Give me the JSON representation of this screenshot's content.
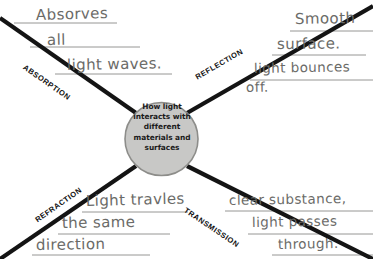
{
  "worksheet": {
    "title": "How light interacts with different materials and surfaces",
    "center": {
      "line1": "How light",
      "line2": "interacts with",
      "line3": "different",
      "line4": "materials and",
      "line5": "surfaces",
      "fill_color": "#c8c8c6",
      "border_color": "#8d8d8a"
    },
    "spokes": [
      {
        "id": "absorption",
        "label": "ABSORPTION",
        "angle": -45
      },
      {
        "id": "reflection",
        "label": "REFLECTION",
        "angle": -45
      },
      {
        "id": "refraction",
        "label": "REFRACTION",
        "angle": 45
      },
      {
        "id": "transmission",
        "label": "TRANSMISSION",
        "angle": 45
      }
    ],
    "answers": {
      "absorption": {
        "line1": "Absorves",
        "line2": "all",
        "line3": "light waves."
      },
      "reflection": {
        "line1": "Smooth",
        "line2": "surface.",
        "line3": "light bounces",
        "line4": "off."
      },
      "refraction": {
        "line1": "Light travles",
        "line2": "the same",
        "line3": "direction"
      },
      "transmission": {
        "line1": "clear substance,",
        "line2": "light passes",
        "line3": "through."
      }
    },
    "ink_color": "#6b6b68",
    "line_color": "#1a1a1a"
  }
}
